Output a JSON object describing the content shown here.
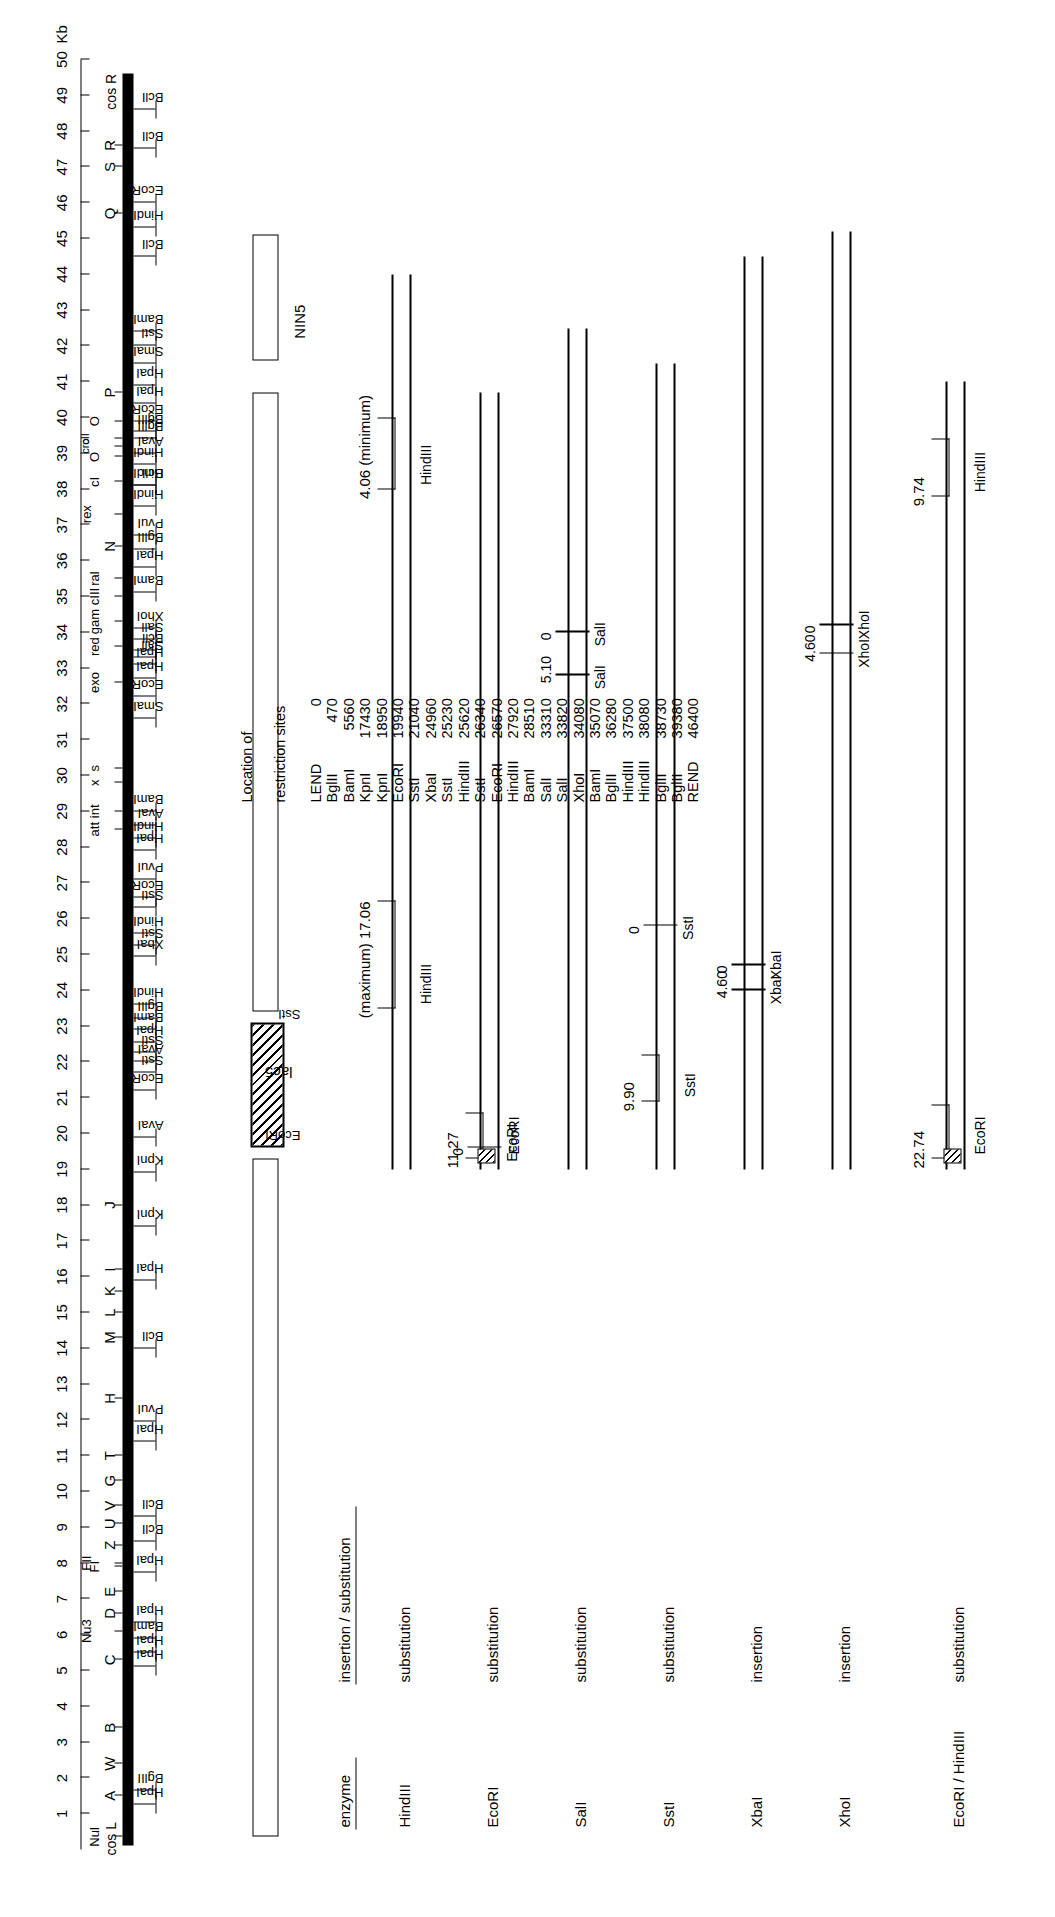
{
  "figure": {
    "scale_unit": "Kb",
    "axis": {
      "min": 0,
      "max": 50,
      "tick_labels": [
        "1",
        "2",
        "3",
        "4",
        "5",
        "6",
        "7",
        "8",
        "9",
        "10",
        "11",
        "12",
        "13",
        "14",
        "15",
        "16",
        "17",
        "18",
        "19",
        "20",
        "21",
        "22",
        "23",
        "24",
        "25",
        "26",
        "27",
        "28",
        "29",
        "30",
        "31",
        "32",
        "33",
        "34",
        "35",
        "36",
        "37",
        "38",
        "39",
        "40",
        "41",
        "42",
        "43",
        "44",
        "45",
        "46",
        "47",
        "48",
        "49",
        "50"
      ],
      "unit_label": "Kb"
    },
    "cos_left": "cos L",
    "cos_right": "cos R",
    "genes": [
      {
        "label": "Nul",
        "kb": 0.35,
        "size": "small"
      },
      {
        "label": "A",
        "kb": 1.5
      },
      {
        "label": "W",
        "kb": 2.4
      },
      {
        "label": "B",
        "kb": 3.4
      },
      {
        "label": "C",
        "kb": 5.3
      },
      {
        "label": "Nu3",
        "kb": 6.1,
        "size": "small"
      },
      {
        "label": "D",
        "kb": 6.6
      },
      {
        "label": "E",
        "kb": 7.2
      },
      {
        "label": "FI",
        "kb": 7.9,
        "size": "small"
      },
      {
        "label": "FII",
        "kb": 8.0,
        "size": "small"
      },
      {
        "label": "Z",
        "kb": 8.5
      },
      {
        "label": "U",
        "kb": 9.1
      },
      {
        "label": "V",
        "kb": 9.6
      },
      {
        "label": "G",
        "kb": 10.3
      },
      {
        "label": "T",
        "kb": 11.0
      },
      {
        "label": "H",
        "kb": 12.6
      },
      {
        "label": "M",
        "kb": 14.3
      },
      {
        "label": "L",
        "kb": 15.0
      },
      {
        "label": "K",
        "kb": 15.6
      },
      {
        "label": "I",
        "kb": 16.2
      },
      {
        "label": "J",
        "kb": 18.0
      },
      {
        "label": "att",
        "kb": 28.5,
        "size": "small"
      },
      {
        "label": "int",
        "kb": 29.0,
        "size": "small"
      },
      {
        "label": "x",
        "kb": 29.8,
        "size": "small"
      },
      {
        "label": "s",
        "kb": 30.2,
        "size": "small"
      },
      {
        "label": "exo",
        "kb": 32.6,
        "size": "small"
      },
      {
        "label": "red",
        "kb": 33.6,
        "size": "small"
      },
      {
        "label": "gam",
        "kb": 34.3,
        "size": "small"
      },
      {
        "label": "cIII",
        "kb": 35.0,
        "size": "small"
      },
      {
        "label": "ral",
        "kb": 35.5,
        "size": "small"
      },
      {
        "label": "N",
        "kb": 36.4
      },
      {
        "label": "rex",
        "kb": 37.3,
        "size": "small"
      },
      {
        "label": "cI",
        "kb": 38.2,
        "size": "small"
      },
      {
        "label": "O",
        "kb": 38.9,
        "size": "small"
      },
      {
        "label": "cII",
        "kb": 39.4,
        "size": "tiny"
      },
      {
        "label": "O",
        "kb": 39.9,
        "size": "small"
      },
      {
        "label": "cro",
        "kb": 39.2,
        "size": "tiny"
      },
      {
        "label": "P",
        "kb": 40.7
      },
      {
        "label": "Q",
        "kb": 45.7
      },
      {
        "label": "S",
        "kb": 47.0
      },
      {
        "label": "R",
        "kb": 47.6
      }
    ],
    "restriction_sites": [
      {
        "label": "HpaI",
        "kb": 1.25
      },
      {
        "label": "BglII",
        "kb": 1.65
      },
      {
        "label": "HpaI",
        "kb": 5.1
      },
      {
        "label": "HpaI",
        "kb": 5.5
      },
      {
        "label": "BamI",
        "kb": 5.9
      },
      {
        "label": "HpaI",
        "kb": 6.35
      },
      {
        "label": "HpaI",
        "kb": 7.75
      },
      {
        "label": "BclI",
        "kb": 8.6
      },
      {
        "label": "BclI",
        "kb": 9.3
      },
      {
        "label": "HpaI",
        "kb": 11.4
      },
      {
        "label": "PvuI",
        "kb": 11.95
      },
      {
        "label": "BclI",
        "kb": 14.0
      },
      {
        "label": "HpaI",
        "kb": 15.9
      },
      {
        "label": "KpnI",
        "kb": 17.4
      },
      {
        "label": "KpnI",
        "kb": 18.9
      },
      {
        "label": "AvaI",
        "kb": 19.9
      },
      {
        "label": "EcoRI",
        "kb": 21.2
      },
      {
        "label": "SstI",
        "kb": 21.7
      },
      {
        "label": "AvaI",
        "kb": 22.0
      },
      {
        "label": "SstI",
        "kb": 22.25
      },
      {
        "label": "HpaI",
        "kb": 22.55
      },
      {
        "label": "BamI",
        "kb": 22.9
      },
      {
        "label": "BglII",
        "kb": 23.2
      },
      {
        "label": "HindIII",
        "kb": 23.6
      },
      {
        "label": "XbaI",
        "kb": 24.95
      },
      {
        "label": "SstI",
        "kb": 25.25
      },
      {
        "label": "HindIII",
        "kb": 25.6
      },
      {
        "label": "SstI",
        "kb": 26.3
      },
      {
        "label": "EcoRI",
        "kb": 26.6
      },
      {
        "label": "PvuI",
        "kb": 27.1
      },
      {
        "label": "HpaI",
        "kb": 27.9
      },
      {
        "label": "HindIII",
        "kb": 28.25
      },
      {
        "label": "AvaI",
        "kb": 28.6
      },
      {
        "label": "BamI",
        "kb": 29.0
      },
      {
        "label": "SmaI",
        "kb": 31.6
      },
      {
        "label": "EcoRI",
        "kb": 32.2
      },
      {
        "label": "HpaI",
        "kb": 32.7
      },
      {
        "label": "HpaI",
        "kb": 33.1
      },
      {
        "label": "BclI",
        "kb": 33.5
      },
      {
        "label": "SalI",
        "kb": 33.3
      },
      {
        "label": "SalI",
        "kb": 33.8
      },
      {
        "label": "XhoI",
        "kb": 34.1
      },
      {
        "label": "BamI",
        "kb": 35.1
      },
      {
        "label": "HpaI",
        "kb": 35.8
      },
      {
        "label": "BglII",
        "kb": 36.3
      },
      {
        "label": "PvuI",
        "kb": 36.7
      },
      {
        "label": "HindIII",
        "kb": 37.5
      },
      {
        "label": "BclI",
        "kb": 38.1
      },
      {
        "label": "HindIII",
        "kb": 38.1
      },
      {
        "label": "HindIII",
        "kb": 38.7
      },
      {
        "label": "AvaI",
        "kb": 39.0
      },
      {
        "label": "BglII",
        "kb": 39.4
      },
      {
        "label": "BglII",
        "kb": 39.6
      },
      {
        "label": "EcoRI",
        "kb": 39.9
      },
      {
        "label": "HpaI",
        "kb": 40.4
      },
      {
        "label": "HpaI",
        "kb": 40.9
      },
      {
        "label": "SmaI",
        "kb": 41.5
      },
      {
        "label": "SstI",
        "kb": 42.0
      },
      {
        "label": "BamI",
        "kb": 42.4
      },
      {
        "label": "BclI",
        "kb": 44.5
      },
      {
        "label": "HindIII",
        "kb": 45.3
      },
      {
        "label": "EcoRI",
        "kb": 46.0
      },
      {
        "label": "BclI",
        "kb": 47.5
      },
      {
        "label": "BclI",
        "kb": 48.6
      }
    ],
    "lac5": {
      "label": "lac5",
      "left_kb": 19.6,
      "right_kb": 23.0,
      "left_site": "EcoRI",
      "right_site": "SstI"
    },
    "nin5": {
      "label": "NIN5"
    }
  },
  "derivatives": {
    "column_headers": {
      "enzyme": "enzyme",
      "insertion_substitution": "insertion / substitution"
    },
    "rows": [
      {
        "enzyme": "HindIII",
        "type": "substitution",
        "lengths": [
          {
            "value": "(maximum) 17.06",
            "site": "HindIII"
          },
          {
            "value": "4.06 (minimum)",
            "site": "HindIII"
          }
        ],
        "markers": []
      },
      {
        "enzyme": "EcoRI",
        "type": "substitution",
        "lengths": [
          {
            "value": "11.27",
            "site": "EcoRI"
          }
        ],
        "markers": [
          {
            "value": "0",
            "site": "EcoRI"
          }
        ]
      },
      {
        "enzyme": "SalI",
        "type": "substitution",
        "lengths": [],
        "markers": [
          {
            "value": "5.10",
            "site": "SalI"
          },
          {
            "value": "0",
            "site": "SalI"
          }
        ]
      },
      {
        "enzyme": "SstI",
        "type": "substitution",
        "lengths": [
          {
            "value": "9.90",
            "site": "SstI"
          }
        ],
        "markers": [
          {
            "value": "0",
            "site": "SstI"
          }
        ]
      },
      {
        "enzyme": "XbaI",
        "type": "insertion",
        "lengths": [],
        "markers": [
          {
            "value": "4.60",
            "site": "XbaI"
          },
          {
            "value": "0",
            "site": "XbaI"
          }
        ]
      },
      {
        "enzyme": "XhoI",
        "type": "insertion",
        "lengths": [],
        "markers": [
          {
            "value": "4.60",
            "site": "XhoI"
          },
          {
            "value": "0",
            "site": "XhoI"
          }
        ]
      },
      {
        "enzyme": "EcoRI / HindIII",
        "type": "substitution",
        "lengths": [
          {
            "value": "22.74",
            "site": "EcoRI"
          },
          {
            "value": "9.74",
            "site": "HindIII"
          }
        ],
        "markers": []
      }
    ]
  },
  "site_table": {
    "header_line1": "Location of",
    "header_line2": "restriction sites",
    "rows": [
      {
        "enzyme": "LEND",
        "position": "0"
      },
      {
        "enzyme": "BglII",
        "position": "470"
      },
      {
        "enzyme": "BamI",
        "position": "5560"
      },
      {
        "enzyme": "KpnI",
        "position": "17430"
      },
      {
        "enzyme": "KpnI",
        "position": "18950"
      },
      {
        "enzyme": "EcoRI",
        "position": "19940"
      },
      {
        "enzyme": "SstI",
        "position": "21040"
      },
      {
        "enzyme": "XbaI",
        "position": "24960"
      },
      {
        "enzyme": "SstI",
        "position": "25230"
      },
      {
        "enzyme": "HindIII",
        "position": "25620"
      },
      {
        "enzyme": "SstI",
        "position": "26340"
      },
      {
        "enzyme": "EcoRI",
        "position": "26570"
      },
      {
        "enzyme": "HindIII",
        "position": "27920"
      },
      {
        "enzyme": "BamI",
        "position": "28510"
      },
      {
        "enzyme": "SalI",
        "position": "33310"
      },
      {
        "enzyme": "SalI",
        "position": "33820"
      },
      {
        "enzyme": "XhoI",
        "position": "34080"
      },
      {
        "enzyme": "BamI",
        "position": "35070"
      },
      {
        "enzyme": "BglII",
        "position": "36280"
      },
      {
        "enzyme": "HindIII",
        "position": "37500"
      },
      {
        "enzyme": "HindIII",
        "position": "38080"
      },
      {
        "enzyme": "BglII",
        "position": "38730"
      },
      {
        "enzyme": "BglII",
        "position": "39380"
      },
      {
        "enzyme": "REND",
        "position": "46400"
      }
    ]
  }
}
